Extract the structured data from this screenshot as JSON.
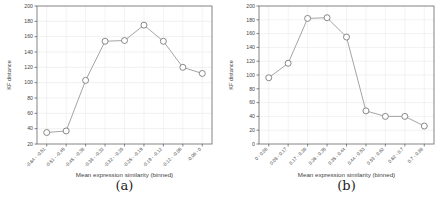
{
  "chart_data": [
    {
      "type": "line",
      "caption": "(a)",
      "title": "",
      "xlabel": "Mean expression similarity (binned)",
      "ylabel": "KF distance",
      "categories": [
        "-0.64 - -0.51",
        "-0.51 - -0.45",
        "-0.45 - -0.38",
        "-0.38 - -0.32",
        "-0.32 - -0.25",
        "-0.25 - -0.19",
        "-0.19 - -0.12",
        "-0.12 - -0.06",
        "-0.06 - 0"
      ],
      "values": [
        35,
        37,
        103,
        154,
        155,
        175,
        154,
        120,
        112
      ],
      "ylim": [
        20,
        200
      ],
      "yticks": [
        20,
        40,
        60,
        80,
        100,
        120,
        140,
        160,
        180,
        200
      ],
      "grid": true,
      "legend": "none",
      "marker": "open-circle",
      "line_color": "#9a9a9a",
      "marker_stroke": "#7a7a7a",
      "marker_fill": "#ffffff",
      "frame_color": "#777777",
      "grid_color": "#e7e7e7",
      "text_color": "#444444"
    },
    {
      "type": "line",
      "caption": "(b)",
      "title": "",
      "xlabel": "Mean expression similarity (binned)",
      "ylabel": "KF distance",
      "categories": [
        "0 - 0.08",
        "0.08 - 0.17",
        "0.17 - 0.26",
        "0.26 - 0.35",
        "0.35 - 0.44",
        "0.44 - 0.53",
        "0.53 - 0.62",
        "0.62 - 0.7",
        "0.7 - 0.88"
      ],
      "values": [
        96,
        117,
        182,
        183,
        155,
        48,
        40,
        40,
        26
      ],
      "ylim": [
        0,
        200
      ],
      "yticks": [
        0,
        20,
        40,
        60,
        80,
        100,
        120,
        140,
        160,
        180,
        200
      ],
      "grid": true,
      "legend": "none",
      "marker": "open-circle",
      "line_color": "#9a9a9a",
      "marker_stroke": "#7a7a7a",
      "marker_fill": "#ffffff",
      "frame_color": "#777777",
      "grid_color": "#e7e7e7",
      "text_color": "#444444"
    }
  ]
}
